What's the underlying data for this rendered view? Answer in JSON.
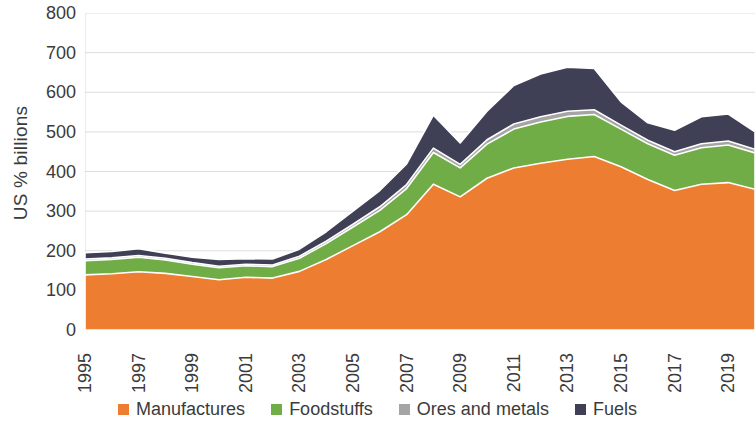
{
  "chart_data": {
    "type": "area",
    "stacked": true,
    "title": "",
    "xlabel": "",
    "ylabel": "US % billions",
    "ylim": [
      0,
      800
    ],
    "ytick_step": 100,
    "yticks": [
      800,
      700,
      600,
      500,
      400,
      300,
      200,
      100,
      0
    ],
    "grid": true,
    "grid_axis": "y",
    "legend_position": "bottom",
    "x": [
      1995,
      1996,
      1997,
      1998,
      1999,
      2000,
      2001,
      2002,
      2003,
      2004,
      2005,
      2006,
      2007,
      2008,
      2009,
      2010,
      2011,
      2012,
      2013,
      2014,
      2015,
      2016,
      2017,
      2018,
      2019,
      2020
    ],
    "xtick_labels": [
      "1995",
      "1997",
      "1999",
      "2001",
      "2003",
      "2005",
      "2007",
      "2009",
      "2011",
      "2013",
      "2015",
      "2017",
      "2019"
    ],
    "series": [
      {
        "name": "Manufactures",
        "color": "#ED7D31",
        "values": [
          139,
          142,
          147,
          143,
          135,
          127,
          133,
          131,
          148,
          178,
          213,
          248,
          291,
          368,
          336,
          383,
          409,
          421,
          431,
          438,
          412,
          380,
          352,
          368,
          372,
          355
        ]
      },
      {
        "name": "Foodstuffs",
        "color": "#70AD47",
        "values": [
          36,
          36,
          37,
          34,
          31,
          30,
          29,
          29,
          33,
          40,
          47,
          54,
          66,
          80,
          73,
          86,
          98,
          104,
          108,
          106,
          95,
          90,
          89,
          92,
          95,
          92
        ]
      },
      {
        "name": "Ores and metals",
        "color": "#A5A5A5",
        "values": [
          4,
          4,
          4,
          4,
          4,
          4,
          4,
          4,
          5,
          6,
          7,
          9,
          10,
          11,
          9,
          11,
          13,
          13,
          13,
          12,
          10,
          9,
          9,
          10,
          10,
          9
        ]
      },
      {
        "name": "Fuels",
        "color": "#3F3F56",
        "values": [
          16,
          16,
          17,
          13,
          14,
          17,
          14,
          15,
          18,
          24,
          33,
          41,
          52,
          83,
          54,
          72,
          97,
          108,
          111,
          104,
          59,
          44,
          54,
          68,
          68,
          44
        ]
      }
    ]
  },
  "legend": {
    "items": [
      {
        "label": "Manufactures",
        "color": "#ED7D31"
      },
      {
        "label": "Foodstuffs",
        "color": "#70AD47"
      },
      {
        "label": "Ores and metals",
        "color": "#A5A5A5"
      },
      {
        "label": "Fuels",
        "color": "#3F3F56"
      }
    ]
  },
  "axis": {
    "y_title": "US % billions"
  },
  "colors": {
    "manufactures": "#ED7D31",
    "foodstuffs": "#70AD47",
    "ores_and_metals": "#A5A5A5",
    "fuels": "#3F3F56",
    "gridline": "#D9D9D9",
    "text": "#3B3B3B",
    "background": "#FFFFFF"
  }
}
